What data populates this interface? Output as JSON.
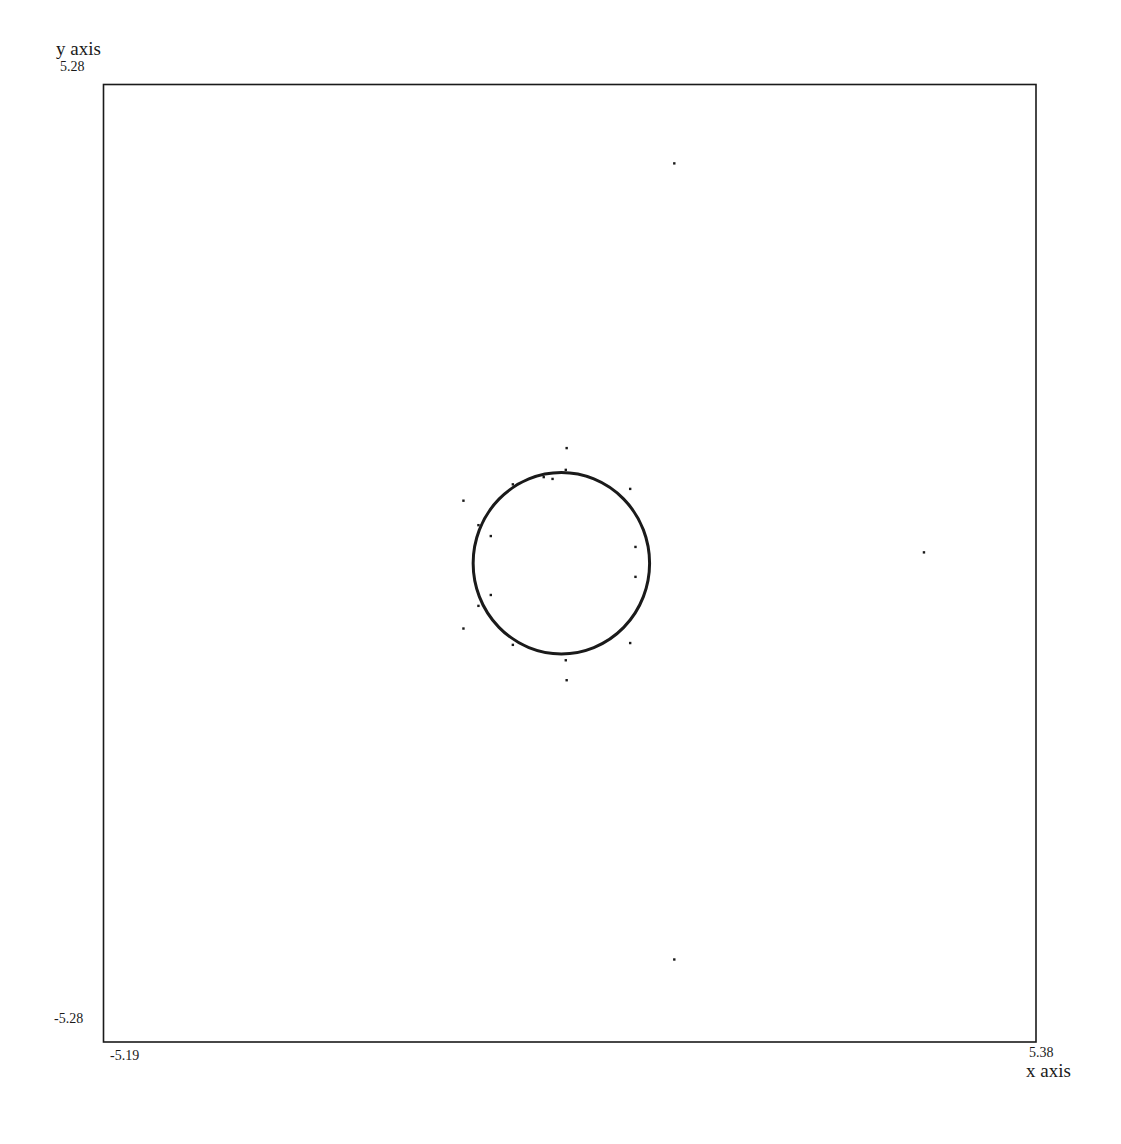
{
  "labels": {
    "y_axis_title": "y axis",
    "x_axis_title": "x axis",
    "y_max": "5.28",
    "y_min": "-5.28",
    "x_min": "-5.19",
    "x_max": "5.38"
  },
  "colors": {
    "ink": "#1a1a1a",
    "background": "#ffffff"
  },
  "chart_data": {
    "type": "scatter",
    "title": "",
    "xlabel": "x axis",
    "ylabel": "y axis",
    "xlim": [
      -5.19,
      5.38
    ],
    "ylim": [
      -5.28,
      5.28
    ],
    "grid": false,
    "legend": null,
    "tick_labels": {
      "x": [
        "-5.19",
        "5.38"
      ],
      "y": [
        "-5.28",
        "5.28"
      ]
    },
    "series": [
      {
        "name": "fitted circle",
        "kind": "curve",
        "center": [
          0.0,
          0.0
        ],
        "radius": 1.0
      },
      {
        "name": "points near circle",
        "kind": "scatter",
        "points": [
          [
            0.06,
            1.27
          ],
          [
            0.06,
            -1.29
          ],
          [
            -1.11,
            0.69
          ],
          [
            -1.11,
            -0.72
          ],
          [
            -0.94,
            0.42
          ],
          [
            -0.94,
            -0.47
          ],
          [
            -0.8,
            0.3
          ],
          [
            -0.8,
            -0.35
          ],
          [
            -0.55,
            0.87
          ],
          [
            -0.55,
            -0.9
          ],
          [
            0.78,
            0.82
          ],
          [
            0.78,
            -0.88
          ],
          [
            0.84,
            0.18
          ],
          [
            0.84,
            -0.15
          ],
          [
            -0.2,
            0.95
          ],
          [
            -0.1,
            0.93
          ],
          [
            0.05,
            1.03
          ],
          [
            0.05,
            -1.07
          ]
        ]
      },
      {
        "name": "far outliers",
        "kind": "scatter",
        "points": [
          [
            1.28,
            4.41
          ],
          [
            1.28,
            -4.37
          ],
          [
            4.11,
            0.12
          ]
        ]
      }
    ]
  }
}
